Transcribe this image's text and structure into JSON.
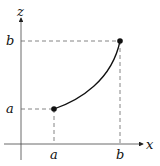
{
  "diagram": {
    "axes": {
      "horizontal_label": "x",
      "vertical_label": "z"
    },
    "x_ticks": [
      {
        "label": "a"
      },
      {
        "label": "b"
      }
    ],
    "z_ticks": [
      {
        "label": "a"
      },
      {
        "label": "b"
      }
    ],
    "points": [
      {
        "name": "start",
        "x": "a",
        "z": "a"
      },
      {
        "name": "end",
        "x": "b",
        "z": "b"
      }
    ],
    "curve": "increasing convex curve from (a,a) to (b,b)",
    "colors": {
      "ink": "#111111",
      "dashes": "#555555"
    }
  }
}
